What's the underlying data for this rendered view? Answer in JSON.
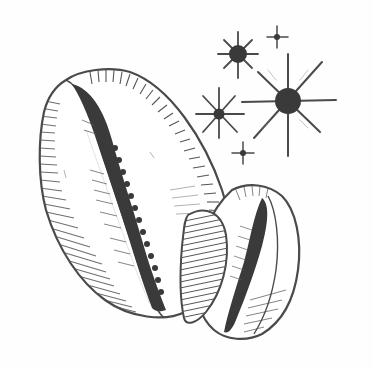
{
  "illustration": {
    "subject": "two cowrie shells with sparkles",
    "style": "monochrome engraving",
    "colors": {
      "background": "#fefefe",
      "ink": "#4a4a4a",
      "dark_ink": "#3a3a3a",
      "shell_fill": "#ffffff"
    },
    "elements": [
      {
        "name": "large-cowrie-shell",
        "icon": "cowrie-shell-icon"
      },
      {
        "name": "small-cowrie-shell",
        "icon": "cowrie-shell-icon"
      },
      {
        "name": "sparkle-large",
        "icon": "sparkle-icon"
      },
      {
        "name": "sparkle-medium-top",
        "icon": "sparkle-icon"
      },
      {
        "name": "sparkle-medium-left",
        "icon": "sparkle-icon"
      },
      {
        "name": "sparkle-small-top-right",
        "icon": "sparkle-icon"
      },
      {
        "name": "sparkle-small-bottom",
        "icon": "sparkle-icon"
      }
    ]
  }
}
